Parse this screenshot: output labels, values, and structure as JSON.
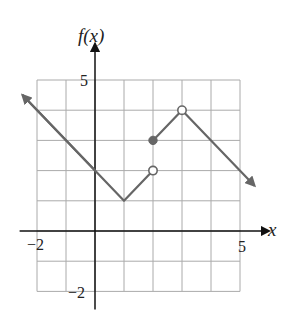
{
  "chart_data": {
    "type": "line",
    "title": "",
    "xlabel": "x",
    "ylabel": "f(x)",
    "xlim": [
      -2,
      5
    ],
    "ylim": [
      -2,
      5
    ],
    "grid": true,
    "x_tick_labels": [
      "-2",
      "5"
    ],
    "y_tick_labels": [
      "5",
      "-2"
    ],
    "segments": [
      {
        "points": [
          [
            -2.5,
            4.5
          ],
          [
            0,
            2
          ],
          [
            1,
            1
          ],
          [
            2,
            2
          ]
        ],
        "start": "arrow",
        "end": "open"
      },
      {
        "points": [
          [
            2,
            3
          ],
          [
            3,
            4
          ],
          [
            5.5,
            1.5
          ]
        ],
        "start": "closed",
        "end": "arrow",
        "open_at": [
          [
            3,
            4
          ]
        ]
      }
    ],
    "open_points": [
      [
        2,
        2
      ],
      [
        3,
        4
      ]
    ],
    "closed_points": [
      [
        2,
        3
      ]
    ],
    "colors": {
      "curve": "#666666",
      "grid": "#aaaaaa",
      "axis": "#222222"
    }
  },
  "labels": {
    "y_axis": "f(x)",
    "x_axis": "x",
    "x_min": "−2",
    "x_max": "5",
    "y_max": "5",
    "y_min": "−2"
  }
}
